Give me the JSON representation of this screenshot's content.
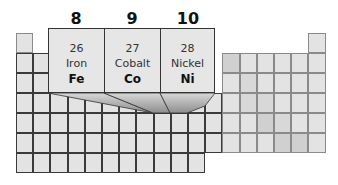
{
  "groups": [
    {
      "label": "8",
      "number": "26",
      "name": "Iron",
      "symbol": "Fe"
    },
    {
      "label": "9",
      "number": "27",
      "name": "Cobalt",
      "symbol": "Co"
    },
    {
      "label": "10",
      "number": "28",
      "name": "Nickel",
      "symbol": "Ni"
    }
  ],
  "colors": {
    "cell": "#e3e3e3",
    "grid_line": "#3a3a3a",
    "callout_bg": "#e6e6e6",
    "shaded_cell": "#d0d0d0"
  }
}
